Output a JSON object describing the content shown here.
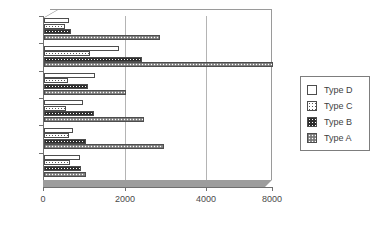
{
  "chart_data": {
    "type": "bar",
    "orientation": "horizontal",
    "title": "",
    "xlabel": "",
    "ylabel": "",
    "categories": [
      "Jan",
      "Dec",
      "Nov",
      "Oct",
      "Sept",
      "Aug"
    ],
    "series": [
      {
        "name": "Type D",
        "pattern": "blank-white",
        "values": [
          620,
          1820,
          1250,
          950,
          700,
          880
        ]
      },
      {
        "name": "Type C",
        "pattern": "sparse-dots",
        "values": [
          520,
          1120,
          580,
          530,
          620,
          640
        ]
      },
      {
        "name": "Type B",
        "pattern": "dark-checker",
        "values": [
          660,
          2400,
          1080,
          1230,
          1020,
          900
        ]
      },
      {
        "name": "Type A",
        "pattern": "gray-dots",
        "values": [
          2850,
          8000,
          2000,
          2450,
          2950,
          1030
        ]
      }
    ],
    "xticks": [
      {
        "label": "0",
        "value": 0,
        "pixel": 43
      },
      {
        "label": "2000",
        "value": 2000,
        "pixel": 125
      },
      {
        "label": "4000",
        "value": 4000,
        "pixel": 206
      },
      {
        "label": "8000",
        "value": 8000,
        "pixel": 272
      }
    ],
    "xlim": [
      0,
      8000
    ],
    "grid": true,
    "gridlines_at": [
      2000,
      4000
    ],
    "legend_position": "right",
    "legend_entries": [
      "Type D",
      "Type C",
      "Type B",
      "Type A"
    ],
    "style": "3d-perspective-floor",
    "colors": {
      "axis": "#6f6f6f",
      "gridline": "#b4b4b4",
      "floor": "#9d9d9d",
      "bar_outline": "#4d4d4d",
      "type_d": "#ffffff",
      "type_b": "#2e2e2e",
      "type_a": "#8e8e8e",
      "text": "#4a4a4a"
    }
  }
}
